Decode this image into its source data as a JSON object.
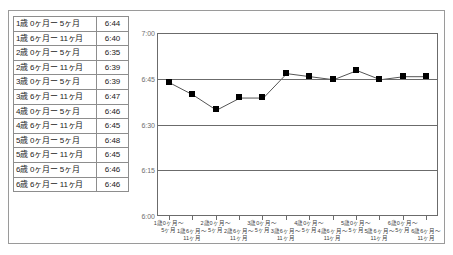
{
  "figure": {
    "axis": {
      "y_ticks": [
        "7:00",
        "6:45",
        "6:30",
        "6:15",
        "6:00"
      ]
    }
  },
  "table": {
    "rows": [
      {
        "label": "1歳 0ヶ月ー 5ヶ月",
        "value": "6:44"
      },
      {
        "label": "1歳 6ヶ月ー 11ヶ月",
        "value": "6:40"
      },
      {
        "label": "2歳 0ヶ月ー 5ヶ月",
        "value": "6:35"
      },
      {
        "label": "2歳 6ヶ月ー 11ヶ月",
        "value": "6:39"
      },
      {
        "label": "3歳 0ヶ月ー 5ヶ月",
        "value": "6:39"
      },
      {
        "label": "3歳 6ヶ月ー 11ヶ月",
        "value": "6:47"
      },
      {
        "label": "4歳 0ヶ月ー 5ヶ月",
        "value": "6:46"
      },
      {
        "label": "4歳 6ヶ月ー 11ヶ月",
        "value": "6:45"
      },
      {
        "label": "5歳 0ヶ月ー 5ヶ月",
        "value": "6:48"
      },
      {
        "label": "5歳 6ヶ月ー 11ヶ月",
        "value": "6:45"
      },
      {
        "label": "6歳 0ヶ月ー 5ヶ月",
        "value": "6:46"
      },
      {
        "label": "6歳 6ヶ月ー 11ヶ月",
        "value": "6:46"
      }
    ]
  },
  "chart_data": {
    "type": "line",
    "title": "",
    "xlabel": "",
    "ylabel": "",
    "grid": true,
    "legend": "none",
    "marker": "square",
    "marker_color": "#000000",
    "line_color": "#555555",
    "categories": [
      "1歳0ヶ月～\n5ヶ月",
      "1歳6ヶ月～\n11ヶ月",
      "2歳0ヶ月～\n5ヶ月",
      "2歳6ヶ月～\n11ヶ月",
      "3歳0ヶ月～\n5ヶ月",
      "3歳6ヶ月～\n11ヶ月",
      "4歳0ヶ月～\n5ヶ月",
      "4歳6ヶ月～\n11ヶ月",
      "5歳0ヶ月～\n5ヶ月",
      "5歳6ヶ月～\n11ヶ月",
      "6歳0ヶ月～\n5ヶ月",
      "6歳6ヶ月～\n11ヶ月"
    ],
    "categories_line1": [
      "1歳0ヶ月～",
      "1歳6ヶ月～",
      "2歳0ヶ月～",
      "2歳6ヶ月～",
      "3歳0ヶ月～",
      "3歳6ヶ月～",
      "4歳0ヶ月～",
      "4歳6ヶ月～",
      "5歳0ヶ月～",
      "5歳6ヶ月～",
      "6歳0ヶ月～",
      "6歳6ヶ月～"
    ],
    "categories_line2": [
      "5ヶ月",
      "11ヶ月",
      "5ヶ月",
      "11ヶ月",
      "5ヶ月",
      "11ヶ月",
      "5ヶ月",
      "11ヶ月",
      "5ヶ月",
      "11ヶ月",
      "5ヶ月",
      "11ヶ月"
    ],
    "values": [
      "6:44",
      "6:40",
      "6:35",
      "6:39",
      "6:39",
      "6:47",
      "6:46",
      "6:45",
      "6:48",
      "6:45",
      "6:46",
      "6:46"
    ],
    "values_minutes": [
      404,
      400,
      395,
      399,
      399,
      407,
      406,
      405,
      408,
      405,
      406,
      406
    ],
    "ylim_minutes": [
      360,
      420
    ],
    "ytick_minutes": [
      420,
      405,
      390,
      375,
      360
    ],
    "ylim": [
      "6:00",
      "7:00"
    ]
  }
}
